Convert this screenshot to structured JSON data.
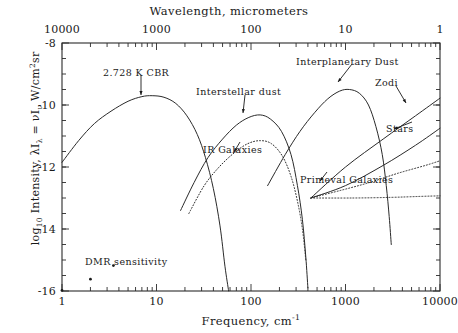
{
  "figure": {
    "top_axis_title": "Wavelength, micrometers",
    "bottom_axis_title": "Frequency, cm",
    "bottom_axis_exponent": "-1",
    "y_axis_title_prefix": "log",
    "y_axis_title_sub": "10",
    "y_axis_title_rest": " Intensity, λI",
    "y_axis_title_sub2": "λ",
    "y_axis_title_mid": " = νI",
    "y_axis_title_sub3": "ν",
    "y_axis_title_end": " W/cm",
    "y_axis_title_sup": "2",
    "y_axis_title_tail": "sr"
  },
  "axes": {
    "x_ticks": [
      "1",
      "10",
      "100",
      "1000",
      "10000"
    ],
    "x_values": [
      1,
      10,
      100,
      1000,
      10000
    ],
    "x_log_range": [
      0,
      4
    ],
    "top_ticks": [
      "10000",
      "1000",
      "100",
      "10",
      "1"
    ],
    "top_values": [
      10000,
      1000,
      100,
      10,
      1
    ],
    "y_ticks": [
      "-8",
      "-10",
      "-12",
      "-14",
      "-16"
    ],
    "y_values": [
      -8,
      -10,
      -12,
      -14,
      -16
    ],
    "y_range": [
      -16,
      -8
    ]
  },
  "annotations": [
    {
      "name": "cbr",
      "text": "2.728 K CBR",
      "x": 103,
      "y": 68,
      "arrow": {
        "x1": 141,
        "y1": 75,
        "x2": 141,
        "y2": 95
      }
    },
    {
      "name": "interstellar-dust",
      "text": "Interstellar dust",
      "x": 196,
      "y": 87,
      "arrow": {
        "x1": 245,
        "y1": 95,
        "x2": 243,
        "y2": 113
      }
    },
    {
      "name": "interplanetary-dust",
      "text": "Interplanetary Dust",
      "x": 296,
      "y": 57,
      "arrow": {
        "x1": 352,
        "y1": 64,
        "x2": 338,
        "y2": 82
      }
    },
    {
      "name": "zodi",
      "text": "Zodi",
      "x": 375,
      "y": 78,
      "arrow": {
        "x1": 396,
        "y1": 86,
        "x2": 406,
        "y2": 103
      }
    },
    {
      "name": "stars",
      "text": "Stars",
      "x": 386,
      "y": 124,
      "arrow": {
        "x1": 412,
        "y1": 122,
        "x2": 394,
        "y2": 129
      }
    },
    {
      "name": "ir-galaxies",
      "text": "IR Galaxies",
      "x": 203,
      "y": 145,
      "arrow": {
        "x1": 240,
        "y1": 142,
        "x2": 234,
        "y2": 152
      }
    },
    {
      "name": "primeval-galaxies",
      "text": "Primeval Galaxies",
      "x": 300,
      "y": 175,
      "arrow": {
        "x1": 327,
        "y1": 172,
        "x2": 320,
        "y2": 181
      }
    },
    {
      "name": "dmr-sensitivity",
      "text": "DMR sensitivity",
      "x": 85,
      "y": 257,
      "arrow": null
    }
  ],
  "chart_data": {
    "type": "line",
    "title": "",
    "xlabel": "Frequency, cm-1",
    "ylabel": "log10 Intensity, lambda*I_lambda = nu*I_nu W/cm2sr",
    "xscale": "log",
    "xlim": [
      1,
      10000
    ],
    "ylim": [
      -16,
      -8
    ],
    "top_axis": {
      "label": "Wavelength, micrometers",
      "lim": [
        10000,
        1
      ],
      "scale": "log"
    },
    "grid": false,
    "legend": "none (curves labelled inline with arrows)",
    "series": [
      {
        "name": "2.728 K CBR",
        "style": "solid",
        "points": [
          [
            1.0,
            -11.85
          ],
          [
            1.5,
            -11.15
          ],
          [
            2.2,
            -10.6
          ],
          [
            3.3,
            -10.2
          ],
          [
            5.0,
            -9.88
          ],
          [
            7.0,
            -9.73
          ],
          [
            9.0,
            -9.7
          ],
          [
            12,
            -9.75
          ],
          [
            16,
            -9.95
          ],
          [
            21,
            -10.35
          ],
          [
            27,
            -10.95
          ],
          [
            33,
            -11.7
          ],
          [
            40,
            -12.7
          ],
          [
            47,
            -13.9
          ],
          [
            53,
            -15.2
          ],
          [
            58,
            -16.0
          ]
        ]
      },
      {
        "name": "Interstellar dust",
        "style": "solid",
        "points": [
          [
            18,
            -13.4
          ],
          [
            25,
            -12.5
          ],
          [
            35,
            -11.7
          ],
          [
            50,
            -11.1
          ],
          [
            70,
            -10.65
          ],
          [
            95,
            -10.4
          ],
          [
            125,
            -10.32
          ],
          [
            160,
            -10.45
          ],
          [
            210,
            -10.85
          ],
          [
            265,
            -11.6
          ],
          [
            310,
            -12.6
          ],
          [
            350,
            -13.7
          ],
          [
            380,
            -14.9
          ],
          [
            400,
            -15.9
          ]
        ]
      },
      {
        "name": "Interplanetary Dust",
        "style": "solid",
        "points": [
          [
            150,
            -12.6
          ],
          [
            230,
            -11.6
          ],
          [
            330,
            -10.85
          ],
          [
            470,
            -10.25
          ],
          [
            650,
            -9.8
          ],
          [
            870,
            -9.55
          ],
          [
            1100,
            -9.5
          ],
          [
            1400,
            -9.62
          ],
          [
            1750,
            -10.0
          ],
          [
            2100,
            -10.7
          ],
          [
            2450,
            -11.6
          ],
          [
            2700,
            -12.6
          ],
          [
            2900,
            -13.6
          ],
          [
            3050,
            -14.5
          ]
        ]
      },
      {
        "name": "Zodi",
        "style": "solid",
        "points": [
          [
            430,
            -13.0
          ],
          [
            1000,
            -12.0
          ],
          [
            2500,
            -11.1
          ],
          [
            5500,
            -10.35
          ],
          [
            10000,
            -9.78
          ]
        ]
      },
      {
        "name": "Stars",
        "style": "solid",
        "points": [
          [
            430,
            -13.0
          ],
          [
            1000,
            -12.6
          ],
          [
            2500,
            -11.95
          ],
          [
            5500,
            -11.3
          ],
          [
            10000,
            -10.75
          ]
        ]
      },
      {
        "name": "IR Galaxies",
        "style": "dotted",
        "points": [
          [
            22,
            -13.5
          ],
          [
            32,
            -12.6
          ],
          [
            46,
            -12.0
          ],
          [
            66,
            -11.55
          ],
          [
            92,
            -11.25
          ],
          [
            125,
            -11.15
          ],
          [
            165,
            -11.25
          ],
          [
            215,
            -11.65
          ],
          [
            265,
            -12.3
          ],
          [
            310,
            -13.1
          ],
          [
            350,
            -14.0
          ],
          [
            380,
            -15.0
          ]
        ]
      },
      {
        "name": "Primeval Galaxies",
        "style": "dotted",
        "points": [
          [
            430,
            -13.0
          ],
          [
            900,
            -12.75
          ],
          [
            1800,
            -12.5
          ],
          [
            3600,
            -12.2
          ],
          [
            7000,
            -11.95
          ],
          [
            10000,
            -11.8
          ]
        ]
      },
      {
        "name": "Zodi horizontal component",
        "style": "dotted",
        "points": [
          [
            430,
            -13.0
          ],
          [
            1200,
            -13.0
          ],
          [
            3000,
            -12.98
          ],
          [
            6000,
            -12.95
          ],
          [
            10000,
            -12.93
          ]
        ]
      }
    ],
    "markers": [
      {
        "name": "DMR sensitivity",
        "points": [
          [
            1.0,
            -15.98
          ],
          [
            2.0,
            -15.62
          ],
          [
            3.5,
            -15.18
          ]
        ],
        "marker": "point"
      }
    ]
  }
}
